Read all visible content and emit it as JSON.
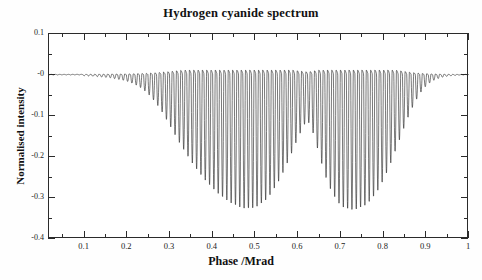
{
  "chart_data": {
    "type": "line",
    "title": "Hydrogen cyanide spectrum",
    "xlabel": "Phase /Mrad",
    "ylabel": "Normalised intensity",
    "xlim": [
      0.0167,
      1.0
    ],
    "ylim": [
      -0.4,
      0.1
    ],
    "grid": false,
    "legend": null,
    "xticks": [
      0.1,
      0.2,
      0.3,
      0.4,
      0.5,
      0.6,
      0.7,
      0.8,
      0.9,
      1
    ],
    "xtick_labels": [
      "0.1",
      "0.2",
      "0.3",
      "0.4",
      "0.5",
      "0.6",
      "0.7",
      "0.8",
      "0.9",
      "1"
    ],
    "yticks": [
      0.1,
      0,
      -0.1,
      -0.2,
      -0.3,
      -0.4
    ],
    "ytick_labels": [
      "0.1",
      "-0",
      "-0.1",
      "-0.2",
      "-0.3",
      "-0.4"
    ],
    "minor_ticks": true,
    "baseline": 0.0,
    "spike_spacing_phase": 0.0101,
    "series": [
      {
        "name": "Normalised intensity",
        "comb_peaks_phase": [
          0.12,
          0.13,
          0.14,
          0.15,
          0.16,
          0.17,
          0.18,
          0.19,
          0.2,
          0.21,
          0.22,
          0.23,
          0.24,
          0.25,
          0.26,
          0.27,
          0.28,
          0.29,
          0.3,
          0.31,
          0.32,
          0.33,
          0.34,
          0.35,
          0.36,
          0.37,
          0.38,
          0.39,
          0.4,
          0.41,
          0.42,
          0.43,
          0.44,
          0.45,
          0.46,
          0.47,
          0.48,
          0.49,
          0.5,
          0.51,
          0.52,
          0.53,
          0.54,
          0.55,
          0.56,
          0.57,
          0.58,
          0.59,
          0.6,
          0.61,
          0.62,
          0.63,
          0.64,
          0.65,
          0.66,
          0.67,
          0.68,
          0.69,
          0.7,
          0.71,
          0.72,
          0.73,
          0.74,
          0.75,
          0.76,
          0.77,
          0.78,
          0.79,
          0.8,
          0.81,
          0.82,
          0.83,
          0.84,
          0.85,
          0.86,
          0.87,
          0.88,
          0.89,
          0.9,
          0.91,
          0.92,
          0.93,
          0.94,
          0.95
        ],
        "comb_depths": [
          -0.004,
          -0.005,
          -0.006,
          -0.007,
          -0.008,
          -0.01,
          -0.012,
          -0.014,
          -0.017,
          -0.021,
          -0.026,
          -0.032,
          -0.04,
          -0.05,
          -0.062,
          -0.076,
          -0.092,
          -0.11,
          -0.129,
          -0.149,
          -0.168,
          -0.186,
          -0.203,
          -0.219,
          -0.234,
          -0.248,
          -0.261,
          -0.273,
          -0.284,
          -0.294,
          -0.303,
          -0.311,
          -0.318,
          -0.324,
          -0.329,
          -0.332,
          -0.334,
          -0.333,
          -0.33,
          -0.325,
          -0.317,
          -0.306,
          -0.292,
          -0.275,
          -0.256,
          -0.234,
          -0.21,
          -0.185,
          -0.16,
          -0.136,
          -0.115,
          -0.13,
          -0.165,
          -0.205,
          -0.242,
          -0.272,
          -0.296,
          -0.314,
          -0.326,
          -0.333,
          -0.336,
          -0.336,
          -0.334,
          -0.33,
          -0.323,
          -0.313,
          -0.3,
          -0.283,
          -0.263,
          -0.24,
          -0.214,
          -0.186,
          -0.157,
          -0.128,
          -0.101,
          -0.077,
          -0.057,
          -0.04,
          -0.028,
          -0.019,
          -0.013,
          -0.009,
          -0.006,
          -0.004
        ]
      }
    ]
  },
  "axes": {
    "y_labels": [
      "0.1",
      "-0",
      "-0.1",
      "-0.2",
      "-0.3",
      "-0.4"
    ],
    "x_labels": [
      "0.1",
      "0.2",
      "0.3",
      "0.4",
      "0.5",
      "0.6",
      "0.7",
      "0.8",
      "0.9",
      "1"
    ],
    "y_title": "Normalised intensity",
    "x_title": "Phase /Mrad"
  },
  "colors": {
    "line": "#262626",
    "frame": "#2b2b2b",
    "background": "#ffffff",
    "text": "#111111"
  }
}
